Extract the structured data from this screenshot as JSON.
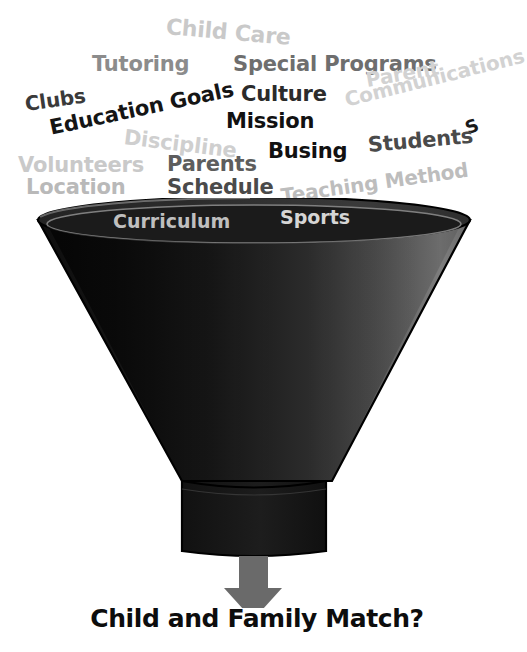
{
  "figure": {
    "type": "funnel-diagram",
    "background_color": "#ffffff",
    "caption": "Child and Family Match?"
  },
  "word_cloud": {
    "description": "Cluster of school-choice consideration factors floating above the funnel mouth",
    "words": [
      {
        "text": "Child Care",
        "x": 166,
        "y": 16,
        "size": 22,
        "color": "#c9c9c9",
        "rotate": 5,
        "weight": "bold"
      },
      {
        "text": "Tutoring",
        "x": 92,
        "y": 54,
        "size": 21,
        "color": "#8c8c8c",
        "rotate": 0,
        "weight": "bold"
      },
      {
        "text": "Special Programs",
        "x": 233,
        "y": 54,
        "size": 21,
        "color": "#6e6e6e",
        "rotate": 0,
        "weight": "bold"
      },
      {
        "text": "Clubs",
        "x": 25,
        "y": 94,
        "size": 20,
        "color": "#3a3a3a",
        "rotate": -8,
        "weight": "bold"
      },
      {
        "text": "Education Goals",
        "x": 50,
        "y": 118,
        "size": 21,
        "color": "#151515",
        "rotate": -12,
        "weight": "bold"
      },
      {
        "text": "Culture",
        "x": 241,
        "y": 84,
        "size": 21,
        "color": "#2b2b2b",
        "rotate": 0,
        "weight": "bold"
      },
      {
        "text": "Parent",
        "x": 366,
        "y": 70,
        "size": 20,
        "color": "#d2d2d2",
        "rotate": -10,
        "weight": "bold"
      },
      {
        "text": "Communications",
        "x": 345,
        "y": 90,
        "size": 20,
        "color": "#d2d2d2",
        "rotate": -14,
        "weight": "bold"
      },
      {
        "text": "Mission",
        "x": 226,
        "y": 111,
        "size": 21,
        "color": "#111111",
        "rotate": 0,
        "weight": "bold"
      },
      {
        "text": "Discipline",
        "x": 124,
        "y": 127,
        "size": 21,
        "color": "#cfcfcf",
        "rotate": 7,
        "weight": "bold"
      },
      {
        "text": "S",
        "x": 466,
        "y": 120,
        "size": 18,
        "color": "#1a1a1a",
        "rotate": -22,
        "weight": "bold"
      },
      {
        "text": "Students",
        "x": 368,
        "y": 135,
        "size": 21,
        "color": "#4a4a4a",
        "rotate": -5,
        "weight": "bold"
      },
      {
        "text": "Busing",
        "x": 268,
        "y": 141,
        "size": 21,
        "color": "#111111",
        "rotate": 0,
        "weight": "bold"
      },
      {
        "text": "Volunteers",
        "x": 18,
        "y": 155,
        "size": 21,
        "color": "#c9c9c9",
        "rotate": 0,
        "weight": "bold"
      },
      {
        "text": "Parents",
        "x": 167,
        "y": 154,
        "size": 21,
        "color": "#5d5d5d",
        "rotate": 0,
        "weight": "bold"
      },
      {
        "text": "Location",
        "x": 26,
        "y": 177,
        "size": 21,
        "color": "#b9b9b9",
        "rotate": 0,
        "weight": "bold"
      },
      {
        "text": "Schedule",
        "x": 167,
        "y": 177,
        "size": 21,
        "color": "#4a4a4a",
        "rotate": 0,
        "weight": "bold"
      },
      {
        "text": "Teaching Method",
        "x": 281,
        "y": 186,
        "size": 20,
        "color": "#bdbdbd",
        "rotate": -8,
        "weight": "bold"
      }
    ]
  },
  "funnel": {
    "rim_words": [
      {
        "text": "Curriculum",
        "x": 113,
        "y": 14,
        "size": 19,
        "color": "#bfbfbf",
        "rotate": 0
      },
      {
        "text": "Sports",
        "x": 280,
        "y": 10,
        "size": 19,
        "color": "#d5d5d5",
        "rotate": 0
      }
    ],
    "colors": {
      "rim_interior_dark": "#1c1c1c",
      "rim_highlight": "#8d8d8d",
      "cone_dark": "#131313",
      "cone_mid": "#3e3e3e",
      "cone_light": "#8a8a8a",
      "stem": "#1a1a1a",
      "outline": "#000000",
      "arrow": "#6a6a6a"
    },
    "arrow": {
      "name": "down-arrow",
      "color": "#6a6a6a"
    }
  }
}
